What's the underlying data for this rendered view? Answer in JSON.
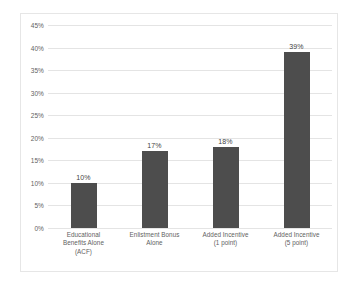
{
  "chart_data": {
    "type": "bar",
    "title": "",
    "subtitle": "",
    "xlabel": "",
    "ylabel": "",
    "categories": [
      "Educational Benefits Alone (ACF)",
      "Enlistment Bonus Alone",
      "Added Incentive (1 point)",
      "Added Incentive (5 point)"
    ],
    "category_lines": [
      [
        "Educational",
        "Benefits Alone",
        "(ACF)"
      ],
      [
        "Enlistment Bonus",
        "Alone"
      ],
      [
        "Added Incentive",
        "(1 point)"
      ],
      [
        "Added Incentive",
        "(5 point)"
      ]
    ],
    "values": [
      10,
      17,
      18,
      39
    ],
    "value_labels": [
      "10%",
      "17%",
      "18%",
      "39%"
    ],
    "ylim": [
      0,
      45
    ],
    "ytick_values": [
      0,
      5,
      10,
      15,
      20,
      25,
      30,
      35,
      40,
      45
    ],
    "ytick_labels": [
      "0%",
      "5%",
      "10%",
      "15%",
      "20%",
      "25%",
      "30%",
      "35%",
      "40%",
      "45%"
    ],
    "grid": "horizontal",
    "legend": "none",
    "bar_color": "#4d4d4d",
    "gridline_color": "#e4e4e4",
    "frame_color": "#e6e6e6",
    "tick_label_color": "#616161",
    "background_color": "#ffffff"
  }
}
